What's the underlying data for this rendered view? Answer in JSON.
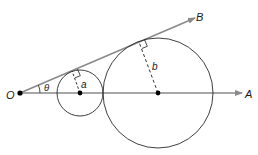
{
  "diagram": {
    "title": "",
    "colors": {
      "ray": "#8a8a8a",
      "circle": "#2a2a2a",
      "point": "#000000",
      "text": "#1a1a1a"
    },
    "points": {
      "origin": {
        "label": "O",
        "x": 20,
        "y": 93
      },
      "ray_a_end": {
        "label": "A",
        "x": 240,
        "y": 93
      },
      "ray_b_end": {
        "label": "B",
        "x": 193,
        "y": 19
      }
    },
    "angle": {
      "label": "θ"
    },
    "circles": [
      {
        "name": "small",
        "cx": 80,
        "cy": 93,
        "r": 23,
        "radius_label": "a",
        "tangent_x": 72,
        "tangent_y": 71
      },
      {
        "name": "large",
        "cx": 158,
        "cy": 93,
        "r": 55,
        "radius_label": "b",
        "tangent_x": 139,
        "tangent_y": 42
      }
    ]
  }
}
